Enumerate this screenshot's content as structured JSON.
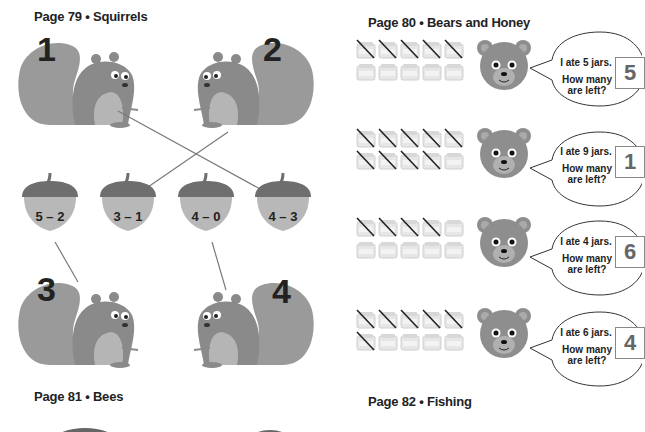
{
  "pages": [
    {
      "id": "p79",
      "heading": "Page 79 • Squirrels"
    },
    {
      "id": "p80",
      "heading": "Page 80 • Bears and Honey"
    },
    {
      "id": "p81",
      "heading": "Page 81 • Bees"
    },
    {
      "id": "p82",
      "heading": "Page 82 • Fishing"
    }
  ],
  "squirrels": {
    "numbers": [
      "1",
      "2",
      "3",
      "4"
    ],
    "acorns": [
      "5 – 2",
      "3 – 1",
      "4 – 0",
      "4 – 3"
    ],
    "matches": [
      {
        "squirrel": "1",
        "acorn": "4 – 3"
      },
      {
        "squirrel": "2",
        "acorn": "3 – 1"
      },
      {
        "squirrel": "3",
        "acorn": "5 – 2"
      },
      {
        "squirrel": "4",
        "acorn": "4 – 0"
      }
    ]
  },
  "bears": {
    "jar_label": "HONEY",
    "question": "How many are left?",
    "rows": [
      {
        "statement": "I ate 5 jars.",
        "crossed": 5,
        "total": 10,
        "answer": "5"
      },
      {
        "statement": "I ate 9 jars.",
        "crossed": 9,
        "total": 10,
        "answer": "1"
      },
      {
        "statement": "I ate 4 jars.",
        "crossed": 4,
        "total": 10,
        "answer": "6"
      },
      {
        "statement": "I ate 6 jars.",
        "crossed": 6,
        "total": 10,
        "answer": "4"
      }
    ]
  },
  "colors": {
    "squirrel_body": "#8a8a8a",
    "squirrel_belly": "#b5b5b5",
    "acorn_cap": "#6e6e6e",
    "acorn_body": "#b8b8b8",
    "bear_face": "#8e8e8e",
    "line": "#7a7a7a"
  }
}
